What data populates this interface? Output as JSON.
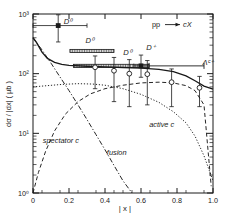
{
  "chart_data": {
    "type": "line",
    "title": "",
    "annotation": "pp → cX",
    "xlabel": "| x |",
    "ylabel": "dσ / |dx|  ( μb )",
    "xlim": [
      0,
      1.0
    ],
    "ylim": [
      1,
      1000
    ],
    "yscale": "log",
    "grid": false,
    "xticks": [
      "0",
      "0.2",
      "0.4",
      "0.6",
      "0.8",
      "1.0"
    ],
    "xtick_values": [
      0,
      0.2,
      0.4,
      0.6,
      0.8,
      1.0
    ],
    "yticks": [
      "10⁰",
      "10¹",
      "10²",
      "10³"
    ],
    "ytick_values": [
      1,
      10,
      100,
      1000
    ],
    "series": [
      {
        "name": "total",
        "style": "solid",
        "points": [
          [
            0.0,
            400
          ],
          [
            0.02,
            330
          ],
          [
            0.05,
            230
          ],
          [
            0.08,
            180
          ],
          [
            0.12,
            155
          ],
          [
            0.16,
            143
          ],
          [
            0.2,
            138
          ],
          [
            0.3,
            133
          ],
          [
            0.4,
            130
          ],
          [
            0.5,
            127
          ],
          [
            0.6,
            124
          ],
          [
            0.7,
            118
          ],
          [
            0.78,
            108
          ],
          [
            0.85,
            92
          ],
          [
            0.9,
            76
          ],
          [
            0.95,
            62
          ],
          [
            1.0,
            55
          ]
        ]
      },
      {
        "name": "spectator c",
        "style": "dashed",
        "label": "spectator c",
        "points": [
          [
            0.0,
            1.0
          ],
          [
            0.03,
            2.2
          ],
          [
            0.07,
            5.0
          ],
          [
            0.12,
            11
          ],
          [
            0.18,
            21
          ],
          [
            0.25,
            34
          ],
          [
            0.32,
            46
          ],
          [
            0.4,
            56
          ],
          [
            0.5,
            64
          ],
          [
            0.6,
            70
          ],
          [
            0.7,
            72
          ],
          [
            0.78,
            70
          ],
          [
            0.85,
            63
          ],
          [
            0.9,
            52
          ],
          [
            0.95,
            30
          ],
          [
            0.99,
            1.3
          ]
        ]
      },
      {
        "name": "active c",
        "style": "dotted",
        "label": "active c",
        "points": [
          [
            0.0,
            60
          ],
          [
            0.08,
            63
          ],
          [
            0.16,
            66
          ],
          [
            0.25,
            68
          ],
          [
            0.33,
            67
          ],
          [
            0.4,
            64
          ],
          [
            0.5,
            56
          ],
          [
            0.6,
            45
          ],
          [
            0.7,
            33
          ],
          [
            0.78,
            23
          ],
          [
            0.85,
            15
          ],
          [
            0.9,
            9
          ],
          [
            0.95,
            4.2
          ],
          [
            1.0,
            1.6
          ]
        ]
      },
      {
        "name": "fusion",
        "style": "dashdot",
        "label": "fusion",
        "points": [
          [
            0.0,
            400
          ],
          [
            0.05,
            250
          ],
          [
            0.1,
            150
          ],
          [
            0.15,
            88
          ],
          [
            0.2,
            52
          ],
          [
            0.25,
            30
          ],
          [
            0.3,
            17
          ],
          [
            0.35,
            9.5
          ],
          [
            0.4,
            5.3
          ],
          [
            0.45,
            2.9
          ],
          [
            0.5,
            1.6
          ],
          [
            0.55,
            1.0
          ]
        ]
      }
    ],
    "data_points": [
      {
        "name": "D0-filled-low-x",
        "marker": "filled-square",
        "x": 0.14,
        "y": 640,
        "xerr_low": 0.14,
        "xerr_high": 0.16,
        "yerr_low": 300,
        "yerr_high": 330,
        "label": "D⁰"
      },
      {
        "name": "D0-filled-mid-x",
        "marker": "filled-square",
        "x": 0.6,
        "y": 135,
        "xerr_low": 0.04,
        "xerr_high": 0.04,
        "yerr_low": 48,
        "yerr_high": 70,
        "label": "D⁺"
      },
      {
        "name": "open-circle-1",
        "marker": "open-circle",
        "x": 0.345,
        "y": 128,
        "yerr_low": 72,
        "yerr_high": 70
      },
      {
        "name": "open-circle-2",
        "marker": "open-circle",
        "x": 0.45,
        "y": 112,
        "yerr_low": 78,
        "yerr_high": 75
      },
      {
        "name": "open-circle-3",
        "marker": "open-circle",
        "x": 0.535,
        "y": 100,
        "yerr_low": 72,
        "yerr_high": 72
      },
      {
        "name": "open-circle-4",
        "marker": "open-circle",
        "x": 0.635,
        "y": 98,
        "yerr_low": 68,
        "yerr_high": 68
      },
      {
        "name": "open-circle-5",
        "marker": "open-circle",
        "x": 0.77,
        "y": 72,
        "yerr_low": 44,
        "yerr_high": 48
      },
      {
        "name": "open-circle-6",
        "marker": "open-circle",
        "x": 0.925,
        "y": 58,
        "yerr_low": 30,
        "yerr_high": 32
      }
    ],
    "bands": [
      {
        "name": "D0-band-low",
        "label": "D⁰",
        "x_start": 0.205,
        "x_end": 0.45,
        "y": 240,
        "style": "hatched"
      },
      {
        "name": "D0-band-mid",
        "label": "D⁰",
        "x_start": 0.225,
        "x_end": 0.645,
        "y": 135,
        "style": "hatched"
      }
    ],
    "brackets": [
      {
        "name": "lambda-c-bracket",
        "x_start": 0.645,
        "x_end": 0.95,
        "y": 135
      }
    ],
    "curve_labels": [
      {
        "name": "spectator-c-label",
        "text": "spectator c",
        "x": 0.155,
        "y": 7.0
      },
      {
        "name": "fusion-label",
        "text": "fusion",
        "x": 0.465,
        "y": 4.4
      },
      {
        "name": "active-c-label",
        "text": "active c",
        "x": 0.715,
        "y": 13.0
      }
    ],
    "point_labels": [
      {
        "name": "d0-label-lowx",
        "text": "D⁰",
        "x": 0.195,
        "y": 690
      },
      {
        "name": "d0-band-label",
        "text": "D⁰",
        "x": 0.315,
        "y": 330
      },
      {
        "name": "d0-label-mid",
        "text": "D⁰",
        "x": 0.525,
        "y": 205
      },
      {
        "name": "dplus-label",
        "text": "D⁺",
        "x": 0.655,
        "y": 250
      },
      {
        "name": "lambda-c-label",
        "text": "Λᶜ⁺",
        "x": 0.975,
        "y": 140
      }
    ]
  },
  "axis": {
    "y_label_text": "dσ / |dx|  ( μb )",
    "x_label_text": "| x |",
    "reaction": "pp",
    "reaction_product": "cX"
  }
}
